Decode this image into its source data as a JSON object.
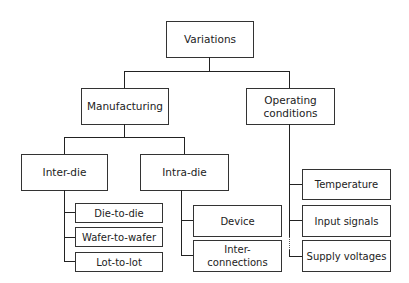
{
  "diagram": {
    "root": "Variations",
    "level1": {
      "manufacturing": "Manufacturing",
      "operating": "Operating conditions"
    },
    "level2": {
      "inter_die": "Inter-die",
      "intra_die": "Intra-die"
    },
    "inter_die_children": [
      "Die-to-die",
      "Wafer-to-wafer",
      "Lot-to-lot"
    ],
    "intra_die_children": [
      "Device",
      "Inter- connections"
    ],
    "operating_children": [
      "Temperature",
      "Input signals",
      "Supply voltages"
    ]
  }
}
